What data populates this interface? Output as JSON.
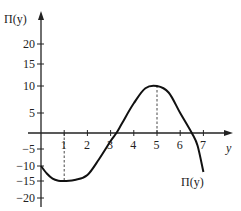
{
  "chart_data": {
    "type": "line",
    "title": "",
    "xlabel": "y",
    "ylabel": "Π(y)",
    "curve_label": "Π(y)",
    "x_ticks": [
      1,
      2,
      3,
      4,
      5,
      6,
      7
    ],
    "y_ticks": [
      20,
      15,
      10,
      5,
      -5,
      -10,
      -15,
      -20
    ],
    "xlim": [
      0,
      7.5
    ],
    "ylim": [
      -22,
      25
    ],
    "grid": false,
    "reference_lines": [
      {
        "x": 1,
        "from": 0,
        "to": -15,
        "style": "dashed"
      },
      {
        "x": 5,
        "from": 0,
        "to": 10,
        "style": "dashed"
      }
    ],
    "series": [
      {
        "name": "Π(y)",
        "points": [
          [
            0,
            -10
          ],
          [
            0.25,
            -12.5
          ],
          [
            0.5,
            -14.2
          ],
          [
            0.75,
            -14.9
          ],
          [
            1,
            -15
          ],
          [
            1.5,
            -14.6
          ],
          [
            2,
            -13
          ],
          [
            2.5,
            -8
          ],
          [
            3,
            -2.5
          ],
          [
            3.25,
            0
          ],
          [
            3.5,
            2.5
          ],
          [
            4,
            6.8
          ],
          [
            4.5,
            9.6
          ],
          [
            5,
            10
          ],
          [
            5.5,
            8.8
          ],
          [
            6,
            5
          ],
          [
            6.5,
            0
          ],
          [
            6.75,
            -4
          ],
          [
            7,
            -12
          ]
        ]
      }
    ],
    "annotations": [
      {
        "text": "Π(y)",
        "near": [
          6.9,
          -16
        ]
      }
    ]
  }
}
